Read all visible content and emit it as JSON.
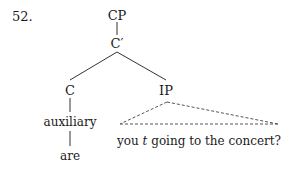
{
  "example": {
    "number": "52."
  },
  "tree": {
    "root": "CP",
    "cbar": "C′",
    "c_head": "C",
    "ip": "IP",
    "c_content": "auxiliary",
    "c_word": "are",
    "ip_content": {
      "before_trace": "you ",
      "trace": "t",
      "after_trace": " going to the concert?"
    }
  },
  "colors": {
    "text": "#1a1a1a",
    "line": "#333333",
    "dashed": "#555555",
    "background": "#ffffff"
  }
}
